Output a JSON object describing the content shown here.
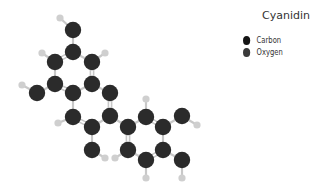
{
  "title": "Cyanidin",
  "legend": [
    {
      "label": "Carbon",
      "color": "#151515"
    },
    {
      "label": "Oxygen",
      "color": "#3a3a3a"
    }
  ],
  "colors": {
    "carbon": "#2b2b2b",
    "oxygen": "#2b2b2b",
    "hydrogen": "#cfcfcf",
    "bond": "#c8c8c8"
  },
  "atoms": [
    {
      "id": "H1",
      "el": "H",
      "x": 60,
      "y": 18
    },
    {
      "id": "O1",
      "el": "O",
      "x": 73,
      "y": 30
    },
    {
      "id": "C1",
      "el": "C",
      "x": 73,
      "y": 52
    },
    {
      "id": "H2",
      "el": "H",
      "x": 42,
      "y": 53
    },
    {
      "id": "H3",
      "el": "H",
      "x": 105,
      "y": 53
    },
    {
      "id": "C2",
      "el": "C",
      "x": 55,
      "y": 62
    },
    {
      "id": "C3",
      "el": "C",
      "x": 92,
      "y": 62
    },
    {
      "id": "C4",
      "el": "C",
      "x": 55,
      "y": 84
    },
    {
      "id": "C5",
      "el": "C",
      "x": 92,
      "y": 84
    },
    {
      "id": "H4",
      "el": "H",
      "x": 22,
      "y": 85
    },
    {
      "id": "O2",
      "el": "O",
      "x": 37,
      "y": 93
    },
    {
      "id": "C6",
      "el": "C",
      "x": 73,
      "y": 93
    },
    {
      "id": "O3",
      "el": "O",
      "x": 110,
      "y": 93
    },
    {
      "id": "C7",
      "el": "C",
      "x": 73,
      "y": 117
    },
    {
      "id": "C8",
      "el": "C",
      "x": 110,
      "y": 116
    },
    {
      "id": "H5",
      "el": "H",
      "x": 58,
      "y": 123
    },
    {
      "id": "C9",
      "el": "C",
      "x": 92,
      "y": 127
    },
    {
      "id": "O4",
      "el": "O",
      "x": 92,
      "y": 150
    },
    {
      "id": "H6",
      "el": "H",
      "x": 105,
      "y": 158
    },
    {
      "id": "C10",
      "el": "C",
      "x": 128,
      "y": 127
    },
    {
      "id": "C11",
      "el": "C",
      "x": 146,
      "y": 117
    },
    {
      "id": "H7",
      "el": "H",
      "x": 146,
      "y": 99
    },
    {
      "id": "C12",
      "el": "C",
      "x": 163,
      "y": 127
    },
    {
      "id": "O5",
      "el": "O",
      "x": 182,
      "y": 116
    },
    {
      "id": "H8",
      "el": "H",
      "x": 197,
      "y": 125
    },
    {
      "id": "C13",
      "el": "C",
      "x": 128,
      "y": 150
    },
    {
      "id": "H9",
      "el": "H",
      "x": 115,
      "y": 158
    },
    {
      "id": "C14",
      "el": "C",
      "x": 163,
      "y": 150
    },
    {
      "id": "C15",
      "el": "C",
      "x": 146,
      "y": 160
    },
    {
      "id": "O6",
      "el": "O",
      "x": 182,
      "y": 160
    },
    {
      "id": "H10",
      "el": "H",
      "x": 146,
      "y": 178
    },
    {
      "id": "H11",
      "el": "H",
      "x": 182,
      "y": 178
    }
  ],
  "bonds": [
    [
      "H1",
      "O1",
      1
    ],
    [
      "O1",
      "C1",
      1
    ],
    [
      "C1",
      "C2",
      2
    ],
    [
      "C1",
      "C3",
      1
    ],
    [
      "C2",
      "H2",
      1
    ],
    [
      "C3",
      "H3",
      1
    ],
    [
      "C2",
      "C4",
      1
    ],
    [
      "C3",
      "C5",
      2
    ],
    [
      "C4",
      "C6",
      2
    ],
    [
      "C5",
      "C6",
      1
    ],
    [
      "C4",
      "O2",
      1
    ],
    [
      "O2",
      "H4",
      1
    ],
    [
      "C5",
      "O3",
      1
    ],
    [
      "O3",
      "C8",
      2
    ],
    [
      "C6",
      "C7",
      1
    ],
    [
      "C7",
      "C9",
      2
    ],
    [
      "C7",
      "H5",
      1
    ],
    [
      "C9",
      "C8",
      1
    ],
    [
      "C9",
      "O4",
      1
    ],
    [
      "O4",
      "H6",
      1
    ],
    [
      "C8",
      "C10",
      1
    ],
    [
      "C10",
      "C11",
      1
    ],
    [
      "C11",
      "C12",
      2
    ],
    [
      "C12",
      "C14",
      1
    ],
    [
      "C14",
      "C15",
      2
    ],
    [
      "C15",
      "C13",
      1
    ],
    [
      "C13",
      "C10",
      2
    ],
    [
      "C11",
      "H7",
      1
    ],
    [
      "C12",
      "O5",
      1
    ],
    [
      "O5",
      "H8",
      1
    ],
    [
      "C13",
      "H9",
      1
    ],
    [
      "C14",
      "O6",
      1
    ],
    [
      "C15",
      "H10",
      1
    ],
    [
      "O6",
      "H11",
      1
    ]
  ]
}
